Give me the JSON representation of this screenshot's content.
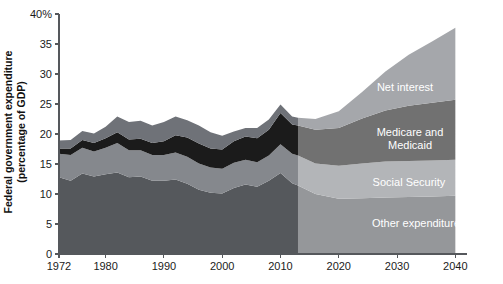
{
  "chart_data": {
    "type": "area",
    "stacked": true,
    "title": "",
    "xlabel": "",
    "ylabel": "Federal government expenditure (percentage of GDP)",
    "xlim": [
      1972,
      2042
    ],
    "ylim": [
      0,
      40
    ],
    "y_tick_labels": [
      "0",
      "5",
      "10",
      "15",
      "20",
      "25",
      "30",
      "35",
      "40%"
    ],
    "y_ticks": [
      0,
      5,
      10,
      15,
      20,
      25,
      30,
      35,
      40
    ],
    "x_ticks": [
      1972,
      1980,
      1990,
      2000,
      2010,
      2020,
      2030,
      2040
    ],
    "x_tick_labels": [
      "1972",
      "1980",
      "1990",
      "2000",
      "2010",
      "2020",
      "2030",
      "2040"
    ],
    "grid": false,
    "legend_position": "inline-annotations",
    "projection_start": 2013,
    "projection_note": "shaded region indicates projections",
    "x": [
      1972,
      1974,
      1976,
      1978,
      1980,
      1982,
      1984,
      1986,
      1988,
      1990,
      1992,
      1994,
      1996,
      1998,
      2000,
      2002,
      2004,
      2006,
      2008,
      2010,
      2012,
      2013,
      2016,
      2020,
      2024,
      2028,
      2032,
      2036,
      2040
    ],
    "series": [
      {
        "name": "Other expenditure",
        "color": "#55585c",
        "values": [
          12.8,
          12.2,
          13.4,
          12.9,
          13.3,
          13.6,
          12.8,
          12.9,
          12.2,
          12.2,
          12.4,
          11.7,
          10.7,
          10.2,
          10.1,
          11.0,
          11.6,
          11.2,
          12.2,
          13.5,
          11.8,
          11.4,
          10.0,
          9.2,
          9.3,
          9.4,
          9.5,
          9.6,
          9.7
        ]
      },
      {
        "name": "Social Security",
        "color": "#85888d",
        "values": [
          3.9,
          4.3,
          4.3,
          4.2,
          4.4,
          4.9,
          4.5,
          4.4,
          4.3,
          4.3,
          4.5,
          4.5,
          4.4,
          4.2,
          4.1,
          4.2,
          4.1,
          4.1,
          4.2,
          4.8,
          4.9,
          5.0,
          5.1,
          5.5,
          5.8,
          6.0,
          6.0,
          6.0,
          6.0
        ]
      },
      {
        "name": "Medicare and Medicaid",
        "color": "#1b1b1b",
        "values": [
          0.9,
          1.1,
          1.3,
          1.4,
          1.6,
          1.8,
          1.8,
          1.9,
          2.0,
          2.3,
          2.9,
          3.2,
          3.3,
          3.2,
          3.2,
          3.6,
          3.9,
          4.0,
          4.3,
          5.2,
          4.9,
          5.0,
          5.6,
          6.3,
          7.5,
          8.5,
          9.2,
          9.6,
          10.0
        ]
      },
      {
        "name": "Net interest",
        "color": "#6f7278",
        "values": [
          1.3,
          1.4,
          1.5,
          1.6,
          1.9,
          2.6,
          2.9,
          3.0,
          2.9,
          3.2,
          3.1,
          2.9,
          3.0,
          2.7,
          2.3,
          1.6,
          1.4,
          1.7,
          1.7,
          1.4,
          1.3,
          1.3,
          1.8,
          2.8,
          4.4,
          6.5,
          8.5,
          10.2,
          12.0
        ]
      }
    ],
    "series_label_positions": [
      {
        "name": "Other expenditure",
        "x_px": 416,
        "y_px": 227
      },
      {
        "name": "Social Security",
        "x_px": 409,
        "y_px": 186
      },
      {
        "name": "Medicare and Medicaid",
        "x_px": 410,
        "y_px": 136
      },
      {
        "name": "Net interest",
        "x_px": 405,
        "y_px": 91
      }
    ]
  }
}
